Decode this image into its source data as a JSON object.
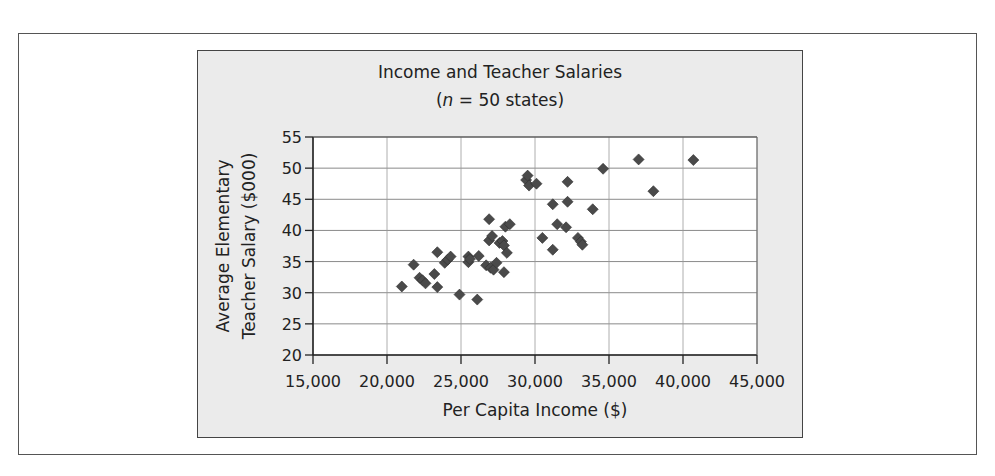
{
  "chart_data": {
    "type": "scatter",
    "title": "Income and Teacher Salaries",
    "subtitle": "(n = 50 states)",
    "subtitle_parts": {
      "open": "(",
      "italic": "n",
      "rest": " = 50 states)"
    },
    "xlabel": "Per Capita Income ($)",
    "ylabel_lines": [
      "Average Elementary",
      "Teacher Salary ($000)"
    ],
    "ylabel": "Average Elementary Teacher Salary ($000)",
    "xlim": [
      15000,
      45000
    ],
    "ylim": [
      20,
      55
    ],
    "x_ticks": [
      15000,
      20000,
      25000,
      30000,
      35000,
      40000,
      45000
    ],
    "x_tick_labels": [
      "15,000",
      "20,000",
      "25,000",
      "30,000",
      "35,000",
      "40,000",
      "45,000"
    ],
    "y_ticks": [
      20,
      25,
      30,
      35,
      40,
      45,
      50,
      55
    ],
    "y_tick_labels": [
      "20",
      "25",
      "30",
      "35",
      "40",
      "45",
      "50",
      "55"
    ],
    "grid": true,
    "legend": null,
    "marker": "diamond",
    "marker_color": "#4a4a4a",
    "points": [
      [
        21000,
        31.0
      ],
      [
        21800,
        34.5
      ],
      [
        22200,
        32.4
      ],
      [
        22400,
        32.0
      ],
      [
        22600,
        31.5
      ],
      [
        23200,
        33.0
      ],
      [
        23400,
        30.9
      ],
      [
        23400,
        36.5
      ],
      [
        23900,
        34.8
      ],
      [
        24100,
        35.3
      ],
      [
        24300,
        35.8
      ],
      [
        24900,
        29.7
      ],
      [
        25500,
        35.8
      ],
      [
        25500,
        34.9
      ],
      [
        25600,
        35.4
      ],
      [
        26100,
        28.9
      ],
      [
        26200,
        35.9
      ],
      [
        26700,
        34.4
      ],
      [
        26900,
        41.8
      ],
      [
        26900,
        38.4
      ],
      [
        27000,
        34.0
      ],
      [
        27100,
        39.1
      ],
      [
        27200,
        33.7
      ],
      [
        27400,
        34.8
      ],
      [
        27600,
        38.0
      ],
      [
        27800,
        38.3
      ],
      [
        27900,
        37.6
      ],
      [
        27900,
        33.3
      ],
      [
        28000,
        40.6
      ],
      [
        28100,
        36.4
      ],
      [
        28300,
        41.0
      ],
      [
        29400,
        48.1
      ],
      [
        29500,
        48.8
      ],
      [
        29600,
        47.2
      ],
      [
        30100,
        47.5
      ],
      [
        30500,
        38.8
      ],
      [
        31200,
        44.2
      ],
      [
        31200,
        36.9
      ],
      [
        31500,
        41.0
      ],
      [
        32100,
        40.5
      ],
      [
        32200,
        44.6
      ],
      [
        32200,
        47.8
      ],
      [
        32900,
        38.8
      ],
      [
        33100,
        38.2
      ],
      [
        33200,
        37.7
      ],
      [
        33900,
        43.4
      ],
      [
        34600,
        49.9
      ],
      [
        37000,
        51.4
      ],
      [
        38000,
        46.3
      ],
      [
        40700,
        51.3
      ]
    ]
  },
  "layout": {
    "plot_left": 313,
    "plot_right": 757,
    "plot_top": 137,
    "plot_bottom": 355
  }
}
